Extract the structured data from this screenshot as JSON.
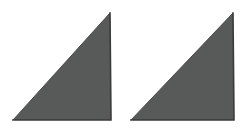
{
  "image": {
    "width": 247,
    "height": 134,
    "background_color": "#ffffff",
    "description": "Two identical gray right triangles side by side"
  },
  "palette": {
    "background": "#ffffff",
    "shape_fill": "#585a5a",
    "shape_fill_light": "#5f6161",
    "edge_dark": "#3a3a3a",
    "edge_hypotenuse": "#4a4c4c"
  },
  "chart_data": {
    "type": "diagram",
    "title": "",
    "shape_count": 2,
    "shapes": [
      {
        "name": "left-triangle",
        "kind": "right-triangle",
        "right_angle_corner": "bottom-right",
        "fill": "#585a5a",
        "stroke": "#3a3a3a",
        "vertices": [
          {
            "label": "apex",
            "x": 110,
            "y": 13
          },
          {
            "label": "bottom-left",
            "x": 13,
            "y": 120
          },
          {
            "label": "bottom-right",
            "x": 111,
            "y": 120
          }
        ],
        "base_width": 98,
        "height": 107
      },
      {
        "name": "right-triangle",
        "kind": "right-triangle",
        "right_angle_corner": "bottom-right",
        "fill": "#585a5a",
        "stroke": "#3a3a3a",
        "vertices": [
          {
            "label": "apex",
            "x": 233,
            "y": 13
          },
          {
            "label": "bottom-left",
            "x": 131,
            "y": 120
          },
          {
            "label": "bottom-right",
            "x": 234,
            "y": 120
          }
        ],
        "base_width": 103,
        "height": 107
      }
    ]
  }
}
